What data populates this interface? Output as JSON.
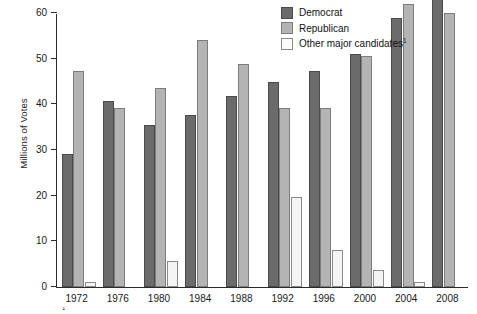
{
  "chart_data": {
    "type": "bar",
    "title": "",
    "xlabel": "",
    "ylabel": "Millions of Votes",
    "ylim": [
      0,
      60
    ],
    "yticks": [
      0,
      10,
      20,
      30,
      40,
      50,
      60
    ],
    "grid": false,
    "legend_position": "top-right",
    "categories": [
      "1972",
      "1976",
      "1980",
      "1984",
      "1988",
      "1992",
      "1996",
      "2000",
      "2004",
      "2008"
    ],
    "series": [
      {
        "name": "Democrat",
        "color": "#6b6b6b",
        "values": [
          29.2,
          40.8,
          35.5,
          37.6,
          41.8,
          44.9,
          47.4,
          51.0,
          59.0,
          69.5
        ]
      },
      {
        "name": "Republican",
        "color": "#b4b4b4",
        "values": [
          47.2,
          39.1,
          43.6,
          54.0,
          48.9,
          39.1,
          39.2,
          50.5,
          62.0,
          59.9
        ]
      },
      {
        "name": "Other major candidates",
        "color": "#f4f4f4",
        "values": [
          1.1,
          0.0,
          5.7,
          0.0,
          0.0,
          19.7,
          8.1,
          3.8,
          1.2,
          0.0
        ]
      }
    ]
  },
  "axes": {
    "y_title": "Millions of Votes",
    "y_tick_labels": [
      "0",
      "10",
      "20",
      "30",
      "40",
      "50",
      "60"
    ],
    "x_tick_labels": [
      "1972",
      "1976",
      "1980",
      "1984",
      "1988",
      "1992",
      "1996",
      "2000",
      "2004",
      "2008"
    ]
  },
  "legend": {
    "items": [
      {
        "label": "Democrat",
        "swatch": "dem"
      },
      {
        "label": "Republican",
        "swatch": "rep"
      },
      {
        "label": "Other major candidates",
        "swatch": "oth",
        "superscript": "1"
      }
    ]
  },
  "footnote": {
    "marker": "1",
    "text": ""
  },
  "colors": {
    "democrat": "#6b6b6b",
    "republican": "#b4b4b4",
    "other": "#f4f4f4",
    "axis": "#2b2b2b"
  }
}
